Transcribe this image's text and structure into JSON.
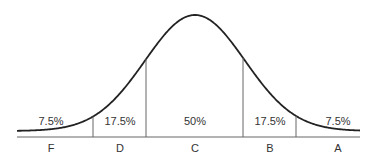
{
  "chart_data": {
    "type": "area",
    "title": "",
    "xlabel": "",
    "ylabel": "",
    "categories": [
      "F",
      "D",
      "C",
      "B",
      "A"
    ],
    "values": [
      7.5,
      17.5,
      50,
      17.5,
      7.5
    ],
    "value_labels": [
      "7.5%",
      "17.5%",
      "50%",
      "17.5%",
      "7.5%"
    ],
    "grid": false,
    "legend": "none",
    "colors": {
      "curve": "#222222",
      "lines": "#555555",
      "text": "#333333"
    }
  },
  "segments": [
    {
      "grade": "F",
      "percent": "7.5%"
    },
    {
      "grade": "D",
      "percent": "17.5%"
    },
    {
      "grade": "C",
      "percent": "50%"
    },
    {
      "grade": "B",
      "percent": "17.5%"
    },
    {
      "grade": "A",
      "percent": "7.5%"
    }
  ]
}
